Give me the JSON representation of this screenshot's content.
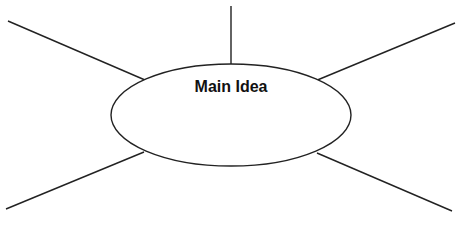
{
  "diagram": {
    "type": "spider-map",
    "center": {
      "label": "Main Idea",
      "cx": 231,
      "cy": 115,
      "rx": 120,
      "ry": 51
    },
    "stroke": "#222222",
    "branches": [
      {
        "name": "branch-top",
        "x1": 231,
        "y1": 6,
        "x2": 231,
        "y2": 64
      },
      {
        "name": "branch-top-left",
        "x1": 8,
        "y1": 21,
        "x2": 145,
        "y2": 80
      },
      {
        "name": "branch-top-right",
        "x1": 315,
        "y1": 81,
        "x2": 455,
        "y2": 23
      },
      {
        "name": "branch-bottom-left",
        "x1": 6,
        "y1": 209,
        "x2": 144,
        "y2": 152
      },
      {
        "name": "branch-bottom-right",
        "x1": 317,
        "y1": 153,
        "x2": 452,
        "y2": 211
      }
    ]
  }
}
